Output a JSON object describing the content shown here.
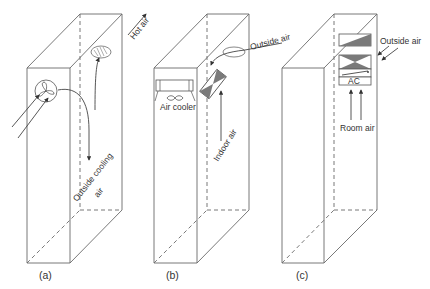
{
  "figure": {
    "panels": [
      {
        "id": "a",
        "caption": "(a)",
        "labels": {
          "hot_air": "Hot air",
          "outside_cooling": "Outside cooling",
          "outside_cooling_2": "air"
        },
        "components": [
          "fan-icon",
          "exhaust-swirl"
        ]
      },
      {
        "id": "b",
        "caption": "(b)",
        "labels": {
          "outside_air": "Outside air",
          "air_cooler": "Air cooler",
          "indoor_air": "Indoor air"
        },
        "components": [
          "air-cooler-unit",
          "heat-exchanger"
        ]
      },
      {
        "id": "c",
        "caption": "(c)",
        "labels": {
          "outside_air": "Outside air",
          "ac": "AC",
          "room_air": "Room air"
        },
        "components": [
          "damper",
          "heat-exchanger",
          "ac-unit"
        ]
      }
    ],
    "colors": {
      "line": "#6a6a6a",
      "shade": "#7a7a7a",
      "text": "#333333"
    }
  }
}
